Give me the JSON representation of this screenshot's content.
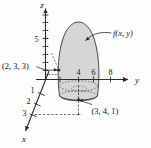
{
  "figure": {
    "title": "",
    "type": "3d-coordinate-diagram",
    "surface_label": "f(x, y)",
    "axes": {
      "z": {
        "label": "z",
        "ticks": [
          "5"
        ]
      },
      "y": {
        "label": "y",
        "ticks": [
          "4",
          "6",
          "8"
        ]
      },
      "x": {
        "label": "x",
        "ticks": [
          "1",
          "2",
          "3"
        ]
      }
    },
    "points": [
      {
        "label": "(2, 3, 3)"
      },
      {
        "label": "(3, 4, 1)"
      }
    ],
    "colors": {
      "surface_fill": "#d6d6d6",
      "surface_stroke": "#3a3a3a",
      "axis_stroke": "#2b2b2b",
      "dashed_stroke": "#4a4a4a",
      "background": "#fdfdfd"
    },
    "caption": ""
  }
}
